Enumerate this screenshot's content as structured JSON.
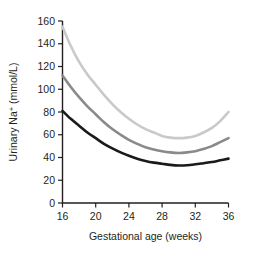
{
  "chart_data": {
    "type": "line",
    "title": "",
    "xlabel": "Gestational age (weeks)",
    "ylabel": "Urinary Na+ (mmol/L)",
    "ylabel_parts": {
      "main": "Urinary Na",
      "superscript": "+",
      "units": " (mmol/L)"
    },
    "xlim": [
      16,
      36
    ],
    "ylim": [
      0,
      160
    ],
    "xticks": [
      16,
      20,
      24,
      28,
      32,
      36
    ],
    "yticks": [
      0,
      20,
      40,
      60,
      80,
      100,
      120,
      140,
      160
    ],
    "xtick_labels": [
      "16",
      "20",
      "24",
      "28",
      "32",
      "36"
    ],
    "ytick_labels": [
      "0",
      "20",
      "40",
      "60",
      "80",
      "100",
      "120",
      "140",
      "160"
    ],
    "grid": false,
    "legend": null,
    "x": [
      16,
      17,
      18,
      19,
      20,
      21,
      22,
      23,
      24,
      25,
      26,
      27,
      28,
      29,
      30,
      31,
      32,
      33,
      34,
      35,
      36
    ],
    "series": [
      {
        "name": "upper-percentile",
        "color": "#c9c9c9",
        "width": 2.6,
        "values": [
          155,
          138,
          124,
          113,
          104,
          95,
          87,
          80,
          74,
          69,
          65,
          62,
          59,
          57.5,
          57,
          57.5,
          59,
          62,
          66,
          72,
          80
        ]
      },
      {
        "name": "median",
        "color": "#8a8a8a",
        "width": 2.6,
        "values": [
          112,
          102,
          93,
          85,
          78,
          71,
          65,
          60,
          55.5,
          52,
          49,
          47,
          45.5,
          44.5,
          44,
          44.5,
          45.5,
          47.5,
          50,
          53.5,
          57
        ]
      },
      {
        "name": "lower-percentile",
        "color": "#1a1a1a",
        "width": 2.6,
        "values": [
          81,
          74,
          68,
          62,
          57,
          52,
          48,
          44.5,
          41.5,
          39,
          37,
          35.5,
          34.5,
          33.5,
          33,
          33.2,
          34,
          35,
          36,
          37.5,
          39
        ]
      }
    ]
  }
}
